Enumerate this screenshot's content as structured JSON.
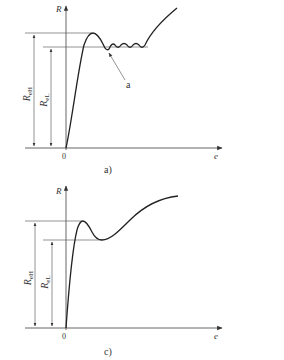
{
  "figure_a": {
    "caption": "a)",
    "y_axis_label": "R",
    "x_axis_label": "e",
    "origin_label": "0",
    "upper_yield_label_main": "R",
    "upper_yield_label_sub": "eH",
    "lower_yield_label_main": "R",
    "lower_yield_label_sub": "eL",
    "annotation_label": "a"
  },
  "figure_c": {
    "caption": "c)",
    "y_axis_label": "R",
    "x_axis_label": "e",
    "origin_label": "0",
    "upper_yield_label_main": "R",
    "upper_yield_label_sub": "eH",
    "lower_yield_label_main": "R",
    "lower_yield_label_sub": "eL"
  },
  "colors": {
    "line": "#555555",
    "curve": "#222222",
    "text": "#333333",
    "background": "#ffffff"
  }
}
